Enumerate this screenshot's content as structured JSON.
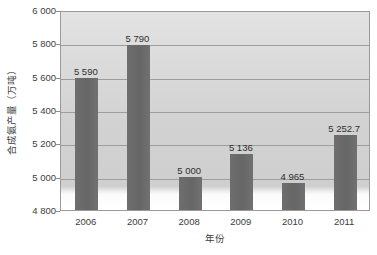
{
  "chart_data": {
    "type": "bar",
    "title": "",
    "xlabel": "年份",
    "ylabel": "合成氨产量（万吨）",
    "categories": [
      "2006",
      "2007",
      "2008",
      "2009",
      "2010",
      "2011"
    ],
    "values": [
      5590,
      5790,
      5000,
      5136,
      4965,
      5252.7
    ],
    "value_labels": [
      "5 590",
      "5 790",
      "5 000",
      "5 136",
      "4 965",
      "5 252.7"
    ],
    "ylim": [
      4800,
      6000
    ],
    "ytick_step": 200,
    "ytick_labels": [
      "6 000",
      "5 800",
      "5 600",
      "5 400",
      "5 200",
      "5 000",
      "4 800"
    ],
    "ytick_values": [
      6000,
      5800,
      5600,
      5400,
      5200,
      5000,
      4800
    ],
    "grid": true,
    "legend": false,
    "legend_position": "none",
    "series": [
      {
        "name": "合成氨产量（万吨）",
        "values": [
          5590,
          5790,
          5000,
          5136,
          4965,
          5252.7
        ]
      }
    ],
    "colors": {
      "bar": "#6c6c6c",
      "plot_background_top": "#e3e3e3",
      "plot_background_bottom": "#ffffff",
      "gridline": "#9d9d9d",
      "border": "#9a9a9a",
      "text": "#3d3d3d"
    }
  }
}
